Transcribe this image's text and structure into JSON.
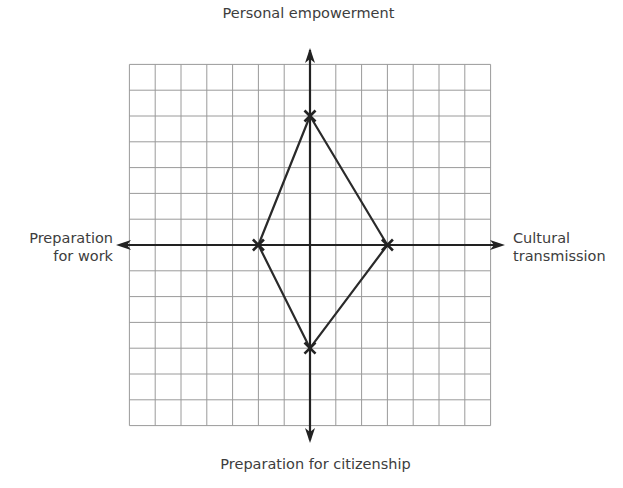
{
  "diagram": {
    "type": "quadrant-radar-grid",
    "axes": {
      "top": "Personal empowerment",
      "bottom": "Preparation for citizenship",
      "left_line1": "Preparation",
      "left_line2": "for work",
      "right_line1": "Cultural",
      "right_line2": "transmission"
    },
    "grid": {
      "cells_per_half": 7,
      "origin_px": [
        310,
        245
      ],
      "cell_px": 25.8,
      "line_color": "#9a9a9a",
      "axis_color": "#222222"
    },
    "polygon": {
      "points": [
        {
          "name": "Personal empowerment",
          "x": 0,
          "y": 5
        },
        {
          "name": "Cultural transmission",
          "x": 3,
          "y": 0
        },
        {
          "name": "Preparation for citizenship",
          "x": 0,
          "y": -4
        },
        {
          "name": "Preparation for work",
          "x": -2,
          "y": 0
        }
      ],
      "stroke": "#2a2a2a",
      "marker": "x"
    }
  }
}
